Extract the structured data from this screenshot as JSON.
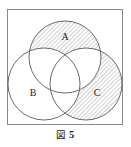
{
  "figure": {
    "caption_label": "図",
    "caption_number": "5",
    "caption_full": "図 5",
    "frame": {
      "border_color": "#8a8a8a",
      "border_width_px": 1,
      "x": 7,
      "y": 9,
      "width": 116,
      "height": 116,
      "background": "#ffffff"
    },
    "diagram_type": "venn-three-circle",
    "stroke_color": "#5a5a5a",
    "hatch_color": "#8d8d8d",
    "label_color": "#1d1d1d",
    "circles": [
      {
        "id": "A",
        "label": "A",
        "cx": 58,
        "cy": 48,
        "r": 36,
        "label_x": 58,
        "label_y": 28,
        "shaded": true
      },
      {
        "id": "B",
        "label": "B",
        "cx": 37,
        "cy": 75,
        "r": 36,
        "label_x": 26,
        "label_y": 84,
        "shaded": false
      },
      {
        "id": "C",
        "label": "C",
        "cx": 79,
        "cy": 75,
        "r": 36,
        "label_x": 90,
        "label_y": 84,
        "shaded": true
      }
    ],
    "shaded_regions": [
      {
        "id": "A-only",
        "description": "A minus B minus C",
        "hatched": true
      },
      {
        "id": "C-only",
        "description": "C minus A minus B",
        "hatched": true
      }
    ],
    "unshaded_regions": [
      {
        "id": "B-only",
        "description": "B minus A minus C",
        "hatched": false
      },
      {
        "id": "A-and-B",
        "description": "A intersect B minus C",
        "hatched": false
      },
      {
        "id": "A-and-C",
        "description": "A intersect C minus B",
        "hatched": false
      },
      {
        "id": "B-and-C",
        "description": "B intersect C minus A",
        "hatched": false
      },
      {
        "id": "A-and-B-and-C",
        "description": "A intersect B intersect C",
        "hatched": false
      }
    ],
    "hatch_angle_deg": 45,
    "hatch_spacing_px": 3
  }
}
